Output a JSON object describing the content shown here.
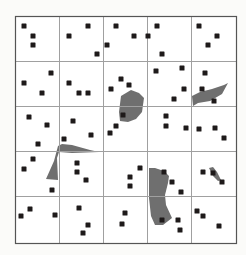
{
  "figure": {
    "frame": {
      "x": 15,
      "y": 16,
      "width": 221,
      "height": 227
    },
    "grid": {
      "rows": 5,
      "cols": 5,
      "v_lines": [
        59,
        103,
        147,
        191
      ],
      "h_lines": [
        61,
        106,
        151,
        196
      ]
    },
    "colors": {
      "background": "#fbfbf9",
      "frame": "#555555",
      "grid": "#a0a0a0",
      "point": "#1e1a1a",
      "patch": "#6f6f6f"
    },
    "point_size": 5,
    "points": [
      [
        24,
        26
      ],
      [
        33,
        36
      ],
      [
        33,
        45
      ],
      [
        69,
        36
      ],
      [
        88,
        26
      ],
      [
        97,
        54
      ],
      [
        107,
        45
      ],
      [
        116,
        26
      ],
      [
        134,
        36
      ],
      [
        157,
        26
      ],
      [
        148,
        36
      ],
      [
        162,
        54
      ],
      [
        199,
        26
      ],
      [
        217,
        36
      ],
      [
        208,
        45
      ],
      [
        24,
        83
      ],
      [
        51,
        73
      ],
      [
        42,
        93
      ],
      [
        69,
        83
      ],
      [
        79,
        93
      ],
      [
        88,
        93
      ],
      [
        111,
        89
      ],
      [
        121,
        79
      ],
      [
        129,
        85
      ],
      [
        156,
        71
      ],
      [
        182,
        68
      ],
      [
        184,
        89
      ],
      [
        174,
        99
      ],
      [
        205,
        73
      ],
      [
        202,
        89
      ],
      [
        214,
        101
      ],
      [
        29,
        117
      ],
      [
        47,
        125
      ],
      [
        38,
        144
      ],
      [
        73,
        121
      ],
      [
        64,
        139
      ],
      [
        91,
        135
      ],
      [
        123,
        115
      ],
      [
        116,
        126
      ],
      [
        110,
        133
      ],
      [
        166,
        116
      ],
      [
        166,
        126
      ],
      [
        186,
        128
      ],
      [
        199,
        129
      ],
      [
        215,
        128
      ],
      [
        224,
        138
      ],
      [
        33,
        159
      ],
      [
        24,
        169
      ],
      [
        52,
        190
      ],
      [
        77,
        163
      ],
      [
        77,
        172
      ],
      [
        86,
        180
      ],
      [
        140,
        168
      ],
      [
        130,
        177
      ],
      [
        130,
        186
      ],
      [
        164,
        172
      ],
      [
        172,
        182
      ],
      [
        181,
        192
      ],
      [
        203,
        172
      ],
      [
        213,
        173
      ],
      [
        222,
        182
      ],
      [
        30,
        209
      ],
      [
        21,
        216
      ],
      [
        55,
        215
      ],
      [
        79,
        208
      ],
      [
        88,
        225
      ],
      [
        83,
        233
      ],
      [
        125,
        213
      ],
      [
        122,
        224
      ],
      [
        162,
        220
      ],
      [
        178,
        220
      ],
      [
        180,
        230
      ],
      [
        197,
        211
      ],
      [
        203,
        216
      ],
      [
        219,
        226
      ]
    ],
    "patches": [
      {
        "name": "patch-center",
        "points": "121,96 131,90 139,93 144,98 142,112 136,119 128,122 120,121 119,112"
      },
      {
        "name": "patch-right",
        "points": "192,96 200,92 212,89 224,85 228,83 222,94 210,101 198,103 193,106"
      },
      {
        "name": "patch-left",
        "points": "58,146 62,144 72,145 90,150 99,152 72,153 59,152 57,158 58,180 46,179 54,161"
      },
      {
        "name": "patch-bottom",
        "points": "149,168 155,168 164,171 169,176 168,183 165,195 166,205 172,218 163,225 155,225 151,216 149,198"
      },
      {
        "name": "patch-small",
        "points": "209,168 213,167 217,172 221,180 218,181 213,176"
      }
    ]
  }
}
